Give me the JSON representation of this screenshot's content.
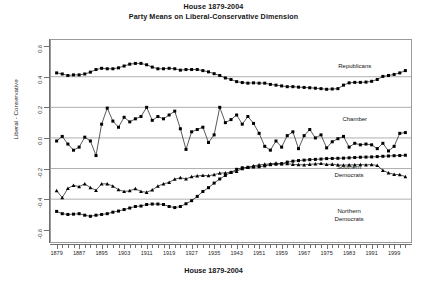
{
  "header": {
    "title": "House 1879-2004",
    "subtitle": "Party Means on Liberal-Conservative Dimension"
  },
  "axes": {
    "x_title": "House 1879-2004",
    "y_title": "Liberal - Conservative"
  },
  "chart_data": {
    "type": "line",
    "title": "House 1879-2004",
    "subtitle": "Party Means on Liberal-Conservative Dimension",
    "xlabel": "House 1879-2004",
    "ylabel": "Liberal - Conservative",
    "xlim": [
      1877,
      2005
    ],
    "ylim": [
      -0.68,
      0.64
    ],
    "yticks": [
      0.6,
      0.4,
      0.2,
      0.0,
      -0.2,
      -0.4,
      -0.6
    ],
    "ytick_labels": [
      "0.6",
      "0.4",
      "0.2",
      "0.0",
      "-0.2",
      "-0.4",
      "-0.6"
    ],
    "xticks": [
      1879,
      1887,
      1895,
      1903,
      1911,
      1919,
      1927,
      1935,
      1943,
      1951,
      1959,
      1967,
      1975,
      1983,
      1991,
      1999
    ],
    "xtick_labels": [
      "1879",
      "1887",
      "1895",
      "1903",
      "1911",
      "1919",
      "1927",
      "1935",
      "1943",
      "1951",
      "1959",
      "1967",
      "1975",
      "1983",
      "1991",
      "1999"
    ],
    "x_minor_step": 2,
    "grid": true,
    "gridlines_y": [
      0.4,
      0.2,
      0.0,
      -0.2,
      -0.4
    ],
    "grid_color": "#8d8d8d",
    "legend": "inline-annotations",
    "marker_color": "#000000",
    "line_color": "#000000",
    "x": [
      1879,
      1881,
      1883,
      1885,
      1887,
      1889,
      1891,
      1893,
      1895,
      1897,
      1899,
      1901,
      1903,
      1905,
      1907,
      1909,
      1911,
      1913,
      1915,
      1917,
      1919,
      1921,
      1923,
      1925,
      1927,
      1929,
      1931,
      1933,
      1935,
      1937,
      1939,
      1941,
      1943,
      1945,
      1947,
      1949,
      1951,
      1953,
      1955,
      1957,
      1959,
      1961,
      1963,
      1965,
      1967,
      1969,
      1971,
      1973,
      1975,
      1977,
      1979,
      1981,
      1983,
      1985,
      1987,
      1989,
      1991,
      1993,
      1995,
      1997,
      1999,
      2001,
      2003
    ],
    "series": [
      {
        "name": "Republicans",
        "marker": "filled-square",
        "values": [
          0.425,
          0.418,
          0.408,
          0.412,
          0.412,
          0.418,
          0.43,
          0.447,
          0.455,
          0.452,
          0.452,
          0.458,
          0.47,
          0.482,
          0.487,
          0.487,
          0.478,
          0.463,
          0.452,
          0.452,
          0.455,
          0.452,
          0.443,
          0.447,
          0.447,
          0.447,
          0.44,
          0.432,
          0.42,
          0.408,
          0.392,
          0.382,
          0.368,
          0.362,
          0.358,
          0.36,
          0.358,
          0.358,
          0.35,
          0.345,
          0.34,
          0.335,
          0.335,
          0.332,
          0.33,
          0.328,
          0.325,
          0.322,
          0.318,
          0.32,
          0.322,
          0.345,
          0.36,
          0.363,
          0.363,
          0.365,
          0.37,
          0.382,
          0.402,
          0.408,
          0.415,
          0.425,
          0.44
        ]
      },
      {
        "name": "Chamber",
        "marker": "filled-square",
        "values": [
          -0.02,
          0.01,
          -0.04,
          -0.08,
          -0.06,
          0.005,
          -0.02,
          -0.115,
          0.09,
          0.195,
          0.11,
          0.07,
          0.135,
          0.105,
          0.125,
          0.14,
          0.2,
          0.115,
          0.14,
          0.125,
          0.15,
          0.175,
          0.06,
          -0.075,
          0.04,
          0.055,
          0.07,
          -0.03,
          0.02,
          0.2,
          0.1,
          0.12,
          0.15,
          0.09,
          0.14,
          0.095,
          0.03,
          -0.055,
          -0.08,
          -0.02,
          -0.06,
          0.015,
          0.04,
          -0.07,
          0.015,
          0.055,
          0.0,
          0.02,
          -0.065,
          -0.025,
          -0.005,
          0.01,
          -0.06,
          -0.035,
          -0.045,
          -0.04,
          -0.045,
          -0.07,
          -0.035,
          -0.085,
          -0.055,
          0.03,
          0.035
        ]
      },
      {
        "name": "Southern Democrats",
        "marker": "filled-triangle",
        "values": [
          -0.345,
          -0.39,
          -0.33,
          -0.31,
          -0.318,
          -0.3,
          -0.325,
          -0.342,
          -0.3,
          -0.3,
          -0.315,
          -0.338,
          -0.35,
          -0.345,
          -0.332,
          -0.35,
          -0.355,
          -0.34,
          -0.315,
          -0.3,
          -0.29,
          -0.27,
          -0.26,
          -0.268,
          -0.253,
          -0.248,
          -0.245,
          -0.247,
          -0.24,
          -0.23,
          -0.228,
          -0.225,
          -0.218,
          -0.2,
          -0.192,
          -0.183,
          -0.176,
          -0.172,
          -0.17,
          -0.165,
          -0.17,
          -0.168,
          -0.173,
          -0.175,
          -0.176,
          -0.172,
          -0.17,
          -0.167,
          -0.173,
          -0.172,
          -0.176,
          -0.178,
          -0.176,
          -0.176,
          -0.174,
          -0.176,
          -0.174,
          -0.18,
          -0.212,
          -0.228,
          -0.238,
          -0.24,
          -0.253
        ]
      },
      {
        "name": "Northern Democrats",
        "marker": "filled-square",
        "values": [
          -0.48,
          -0.495,
          -0.5,
          -0.498,
          -0.495,
          -0.505,
          -0.512,
          -0.505,
          -0.5,
          -0.495,
          -0.485,
          -0.478,
          -0.468,
          -0.458,
          -0.448,
          -0.445,
          -0.435,
          -0.432,
          -0.432,
          -0.435,
          -0.448,
          -0.455,
          -0.448,
          -0.43,
          -0.41,
          -0.382,
          -0.35,
          -0.325,
          -0.295,
          -0.268,
          -0.245,
          -0.225,
          -0.205,
          -0.195,
          -0.192,
          -0.19,
          -0.188,
          -0.183,
          -0.175,
          -0.172,
          -0.168,
          -0.158,
          -0.152,
          -0.148,
          -0.145,
          -0.142,
          -0.14,
          -0.138,
          -0.135,
          -0.134,
          -0.133,
          -0.132,
          -0.13,
          -0.128,
          -0.126,
          -0.125,
          -0.124,
          -0.122,
          -0.12,
          -0.118,
          -0.116,
          -0.115,
          -0.113
        ]
      }
    ],
    "annotations": [
      {
        "text": "Republicans",
        "x": 1985,
        "y": 0.465
      },
      {
        "text": "Chamber",
        "x": 1985,
        "y": 0.115
      },
      {
        "text": "Southern\nDemocrats",
        "x": 1983,
        "y": -0.198
      },
      {
        "text": "Northern\nDemocrats",
        "x": 1983,
        "y": -0.487
      }
    ]
  }
}
